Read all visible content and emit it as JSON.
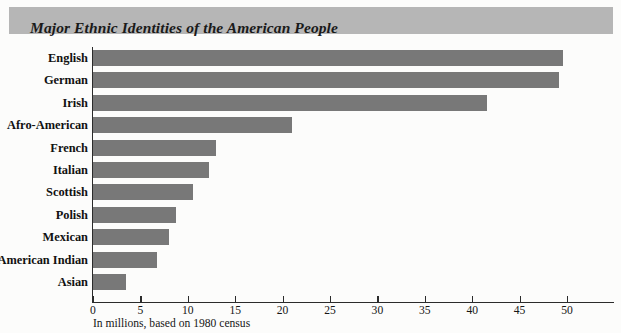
{
  "title": "Major Ethnic Identities of the American People",
  "caption": "In millions, based on 1980 census",
  "colors": {
    "banner": "#b6b6b6",
    "bar": "#787878",
    "axis": "#2b2b2b",
    "text": "#111111",
    "background": "#fcfcfb"
  },
  "chart_data": {
    "type": "bar",
    "orientation": "horizontal",
    "title": "Major Ethnic Identities of the American People",
    "subtitle": "",
    "xlabel": "In millions, based on 1980 census",
    "ylabel": "",
    "xlim": [
      0,
      55
    ],
    "ticks": [
      0,
      5,
      10,
      15,
      20,
      25,
      30,
      35,
      40,
      45,
      50
    ],
    "tick_labels": [
      "0",
      "5",
      "10",
      "15",
      "20",
      "25",
      "30",
      "35",
      "40",
      "45",
      "50"
    ],
    "grid": false,
    "legend": false,
    "categories": [
      "English",
      "German",
      "Irish",
      "Afro-American",
      "French",
      "Italian",
      "Scottish",
      "Polish",
      "Mexican",
      "American Indian",
      "Asian"
    ],
    "values": [
      49.6,
      49.2,
      41.6,
      21.0,
      13.0,
      12.2,
      10.6,
      8.8,
      8.0,
      6.7,
      3.5
    ],
    "units": "millions"
  }
}
